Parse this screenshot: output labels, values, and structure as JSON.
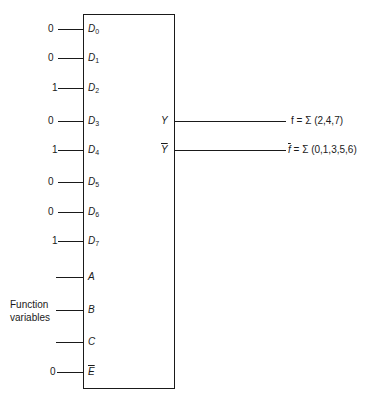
{
  "inputs": [
    {
      "value": "0",
      "label": "D",
      "sub": "0"
    },
    {
      "value": "0",
      "label": "D",
      "sub": "1"
    },
    {
      "value": "1",
      "label": "D",
      "sub": "2"
    },
    {
      "value": "0",
      "label": "D",
      "sub": "3"
    },
    {
      "value": "1",
      "label": "D",
      "sub": "4"
    },
    {
      "value": "0",
      "label": "D",
      "sub": "5"
    },
    {
      "value": "0",
      "label": "D",
      "sub": "6"
    },
    {
      "value": "1",
      "label": "D",
      "sub": "7"
    }
  ],
  "selects": [
    {
      "label": "A"
    },
    {
      "label": "B"
    },
    {
      "label": "C"
    }
  ],
  "select_group_label": [
    "Function",
    "variables"
  ],
  "enable": {
    "value": "0",
    "label": "E"
  },
  "outputs": [
    {
      "label": "Y",
      "expr": "f = Σ (2,4,7)"
    },
    {
      "label": "Y",
      "expr_var": "f",
      "expr_rest": " = Σ (0,1,3,5,6)"
    }
  ]
}
